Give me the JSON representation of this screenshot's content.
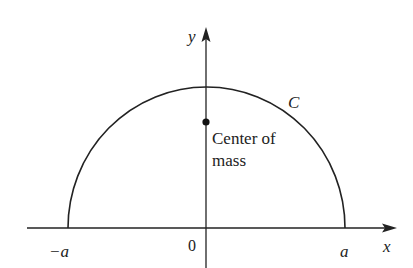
{
  "diagram": {
    "axes": {
      "x_label": "x",
      "y_label": "y",
      "origin_label": "0",
      "neg_a_label": "−a",
      "pos_a_label": "a"
    },
    "curve_label": "C",
    "point": {
      "label_line1": "Center of",
      "label_line2": "mass"
    },
    "colors": {
      "stroke": "#222222",
      "background": "#ffffff"
    }
  }
}
